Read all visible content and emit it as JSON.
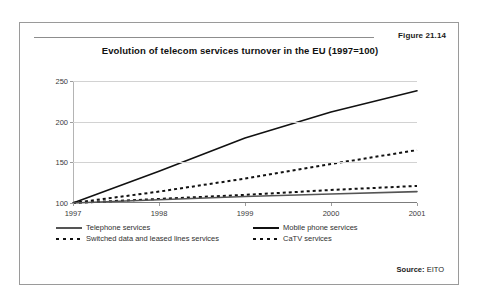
{
  "figure": {
    "number": "Figure 21.14",
    "title": "Evolution of telecom services turnover in the EU (1997=100)",
    "source_label": "Source:",
    "source_value": "EITO"
  },
  "legend": {
    "items": [
      {
        "label": "Telephone services",
        "style": "solid",
        "color": "#555555"
      },
      {
        "label": "Mobile phone services",
        "style": "solid",
        "color": "#111111"
      },
      {
        "label": "Switched data and leased lines services",
        "style": "dotted",
        "color": "#111111"
      },
      {
        "label": "CaTV services",
        "style": "dotted",
        "color": "#111111"
      }
    ]
  },
  "chart_data": {
    "type": "line",
    "title": "Evolution of telecom services turnover in the EU (1997=100)",
    "xlabel": "",
    "ylabel": "",
    "categories": [
      "1997",
      "1998",
      "1999",
      "2000",
      "2001"
    ],
    "x": [
      1997,
      1998,
      1999,
      2000,
      2001
    ],
    "ylim": [
      100,
      250
    ],
    "yticks": [
      100,
      150,
      200,
      250
    ],
    "ytick_labels": [
      "100",
      "150",
      "200",
      "250"
    ],
    "grid": true,
    "legend_position": "bottom",
    "series": [
      {
        "name": "Mobile phone services",
        "style": "solid",
        "color": "#111111",
        "values": [
          100,
          139,
          180,
          212,
          238
        ]
      },
      {
        "name": "Switched data and leased lines services",
        "style": "dotted",
        "color": "#111111",
        "values": [
          100,
          114,
          130,
          148,
          165
        ]
      },
      {
        "name": "CaTV services",
        "style": "dotted",
        "color": "#111111",
        "values": [
          100,
          105,
          110,
          116,
          121
        ]
      },
      {
        "name": "Telephone services",
        "style": "solid",
        "color": "#555555",
        "values": [
          100,
          104,
          108,
          111,
          114
        ]
      }
    ]
  }
}
